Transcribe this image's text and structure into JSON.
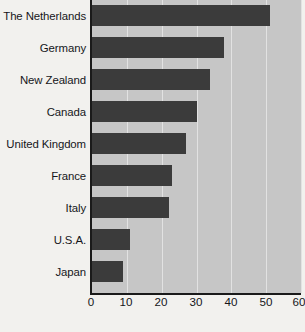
{
  "chart_data": {
    "type": "bar",
    "orientation": "horizontal",
    "title": "",
    "subtitle": "",
    "xlabel": "",
    "ylabel": "",
    "categories": [
      "The Netherlands",
      "Germany",
      "New Zealand",
      "Canada",
      "United Kingdom",
      "France",
      "Italy",
      "U.S.A.",
      "Japan"
    ],
    "values": [
      51,
      38,
      34,
      30,
      27,
      23,
      22,
      11,
      9
    ],
    "series": [
      {
        "name": "",
        "values": [
          51,
          38,
          34,
          30,
          27,
          23,
          22,
          11,
          9
        ]
      }
    ],
    "xlim": [
      0,
      60
    ],
    "xticks": [
      0,
      10,
      20,
      30,
      40,
      50,
      60
    ],
    "xtick_labels": [
      "0",
      "10",
      "20",
      "30",
      "40",
      "50",
      "60"
    ],
    "grid": true,
    "grid_axis": "x",
    "legend": false,
    "legend_position": "none",
    "bar_color": "#3b3b3b",
    "plot_background": "#c6c6c6",
    "gridline_color": "#e2e2e2",
    "axis_color": "#1a1a1a",
    "page_background": "#f2f1ee"
  },
  "caption": {
    "source_text": ""
  }
}
